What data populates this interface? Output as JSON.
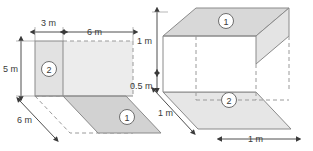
{
  "figure": {
    "title": "",
    "colors": {
      "face_light": "#ececec",
      "face_mid": "#e2e2e2",
      "face_dark": "#d2d2d2",
      "face_white": "#ffffff",
      "stroke": "#8a8a8a",
      "stroke_dark": "#6e6e6e",
      "dash": "#9a9a9a",
      "text": "#3a3a3a",
      "background": "#ffffff"
    },
    "left_figure": {
      "name": "unfolded-net-figure",
      "part_labels": [
        {
          "id": "left-part-2",
          "text": "2"
        },
        {
          "id": "left-part-1",
          "text": "1"
        }
      ],
      "dimensions": [
        {
          "id": "left-top-3m",
          "text": "3 m",
          "orientation": "horizontal"
        },
        {
          "id": "left-top-6m",
          "text": "6 m",
          "orientation": "horizontal"
        },
        {
          "id": "left-side-5m",
          "text": "5 m",
          "orientation": "vertical"
        },
        {
          "id": "left-depth-6m",
          "text": "6 m",
          "orientation": "diagonal"
        }
      ]
    },
    "right_figure": {
      "name": "open-box-figure",
      "part_labels": [
        {
          "id": "right-part-1",
          "text": "1"
        },
        {
          "id": "right-part-2",
          "text": "2"
        }
      ],
      "dimensions": [
        {
          "id": "right-height-1m",
          "text": "1 m",
          "orientation": "vertical"
        },
        {
          "id": "right-height-05m",
          "text": "0.5 m",
          "orientation": "vertical"
        },
        {
          "id": "right-depth-1m",
          "text": "1 m",
          "orientation": "diagonal"
        },
        {
          "id": "right-width-1m",
          "text": "1 m",
          "orientation": "horizontal"
        }
      ]
    }
  }
}
